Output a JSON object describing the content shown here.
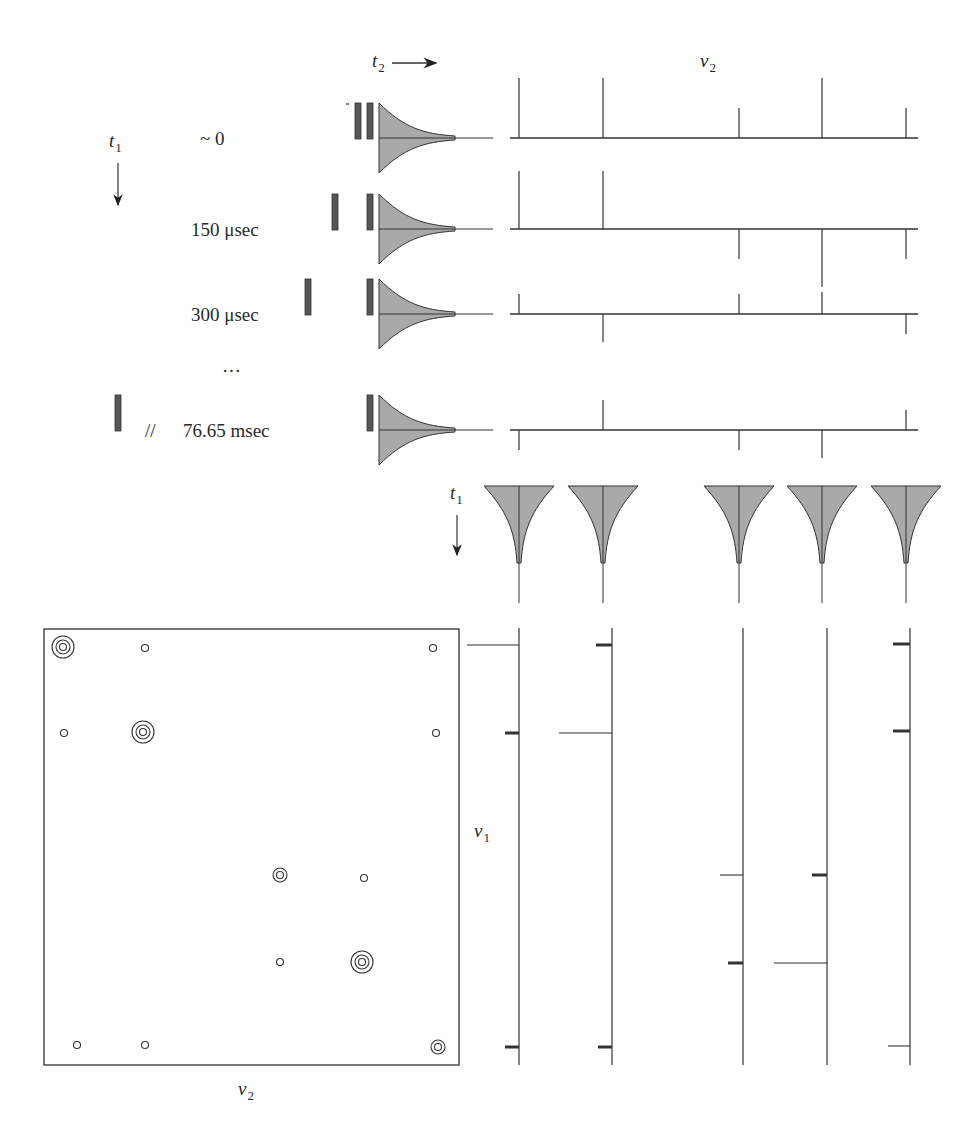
{
  "figure": {
    "colors": {
      "line": "#333333",
      "fid_fill": "#a9a9a9",
      "pulse_fill": "#555555",
      "background": "#ffffff"
    }
  },
  "axes": {
    "t2_label": "t",
    "t2_sub": "2",
    "nu2_top_label": "ν",
    "nu2_top_sub": "2",
    "t1_left_label": "t",
    "t1_left_sub": "1",
    "t1_mid_label": "t",
    "t1_mid_sub": "1",
    "nu1_label": "ν",
    "nu1_sub": "1",
    "nu2_bottom_label": "ν",
    "nu2_bottom_sub": "2"
  },
  "rows": [
    {
      "delay_label": "~ 0",
      "first_pulse_x": 358,
      "spectrum_peaks": [
        60,
        60,
        30,
        60,
        30
      ]
    },
    {
      "delay_label": "150 μsec",
      "first_pulse_x": 335,
      "spectrum_peaks": [
        58,
        58,
        -30,
        -58,
        -30
      ]
    },
    {
      "delay_label": "300 μsec",
      "first_pulse_x": 308,
      "spectrum_peaks": [
        20,
        -28,
        20,
        22,
        -20
      ]
    },
    {
      "ellipsis": "…"
    },
    {
      "delay_label": "76.65 msec",
      "break_mark": "//",
      "first_pulse_x": 118,
      "spectrum_peaks": [
        -20,
        30,
        -20,
        -28,
        20
      ]
    }
  ],
  "peak_positions_nu2": [
    519,
    603,
    739,
    822,
    906
  ],
  "interferogram_columns": [
    519,
    603,
    739,
    822,
    906
  ],
  "nu1_spectra": [
    {
      "column": 519,
      "peaks": [
        {
          "y": 645,
          "len": 52,
          "style": "thin"
        },
        {
          "y": 733,
          "len": 14,
          "style": "thick"
        },
        {
          "y": 1047,
          "len": 14,
          "style": "thick"
        }
      ]
    },
    {
      "column": 612,
      "peaks": [
        {
          "y": 645,
          "len": 16,
          "style": "thick"
        },
        {
          "y": 733,
          "len": 53,
          "style": "thin"
        },
        {
          "y": 1047,
          "len": 14,
          "style": "thick"
        }
      ]
    },
    {
      "column": 743,
      "peaks": [
        {
          "y": 875,
          "len": 23,
          "style": "thin"
        },
        {
          "y": 963,
          "len": 15,
          "style": "thick"
        }
      ]
    },
    {
      "column": 827,
      "peaks": [
        {
          "y": 875,
          "len": 15,
          "style": "thick"
        },
        {
          "y": 963,
          "len": 53,
          "style": "thin"
        }
      ]
    },
    {
      "column": 910,
      "peaks": [
        {
          "y": 644,
          "len": 17,
          "style": "thick"
        },
        {
          "y": 731,
          "len": 17,
          "style": "thick"
        },
        {
          "y": 1046,
          "len": 22,
          "style": "thin"
        }
      ]
    }
  ],
  "contour_map": {
    "box": {
      "x": 44,
      "y": 629,
      "w": 415,
      "h": 436
    },
    "peaks": [
      {
        "x": 63,
        "y": 647,
        "rings": 3
      },
      {
        "x": 145,
        "y": 648,
        "rings": 1
      },
      {
        "x": 433,
        "y": 648,
        "rings": 1
      },
      {
        "x": 64,
        "y": 733,
        "rings": 1
      },
      {
        "x": 143,
        "y": 732,
        "rings": 3
      },
      {
        "x": 436,
        "y": 733,
        "rings": 1
      },
      {
        "x": 280,
        "y": 875,
        "rings": 2
      },
      {
        "x": 364,
        "y": 878,
        "rings": 1
      },
      {
        "x": 280,
        "y": 962,
        "rings": 1
      },
      {
        "x": 362,
        "y": 962,
        "rings": 3
      },
      {
        "x": 77,
        "y": 1045,
        "rings": 1
      },
      {
        "x": 145,
        "y": 1045,
        "rings": 1
      },
      {
        "x": 438,
        "y": 1047,
        "rings": 2
      }
    ]
  }
}
